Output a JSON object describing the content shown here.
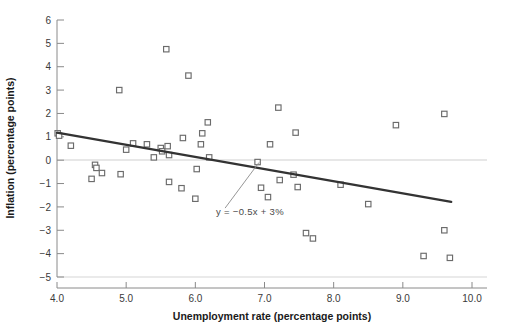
{
  "chart_data": {
    "type": "scatter",
    "title": "",
    "xlabel": "Unemployment rate (percentage points)",
    "ylabel": "Inflation (percentage points)",
    "xlim": [
      4.0,
      10.0
    ],
    "ylim": [
      -5,
      6
    ],
    "xticks": [
      "4.0",
      "5.0",
      "6.0",
      "7.0",
      "8.0",
      "9.0",
      "10.0"
    ],
    "xtick_values": [
      4.0,
      5.0,
      6.0,
      7.0,
      8.0,
      9.0,
      10.0
    ],
    "yticks": [
      "6",
      "5",
      "4",
      "3",
      "2",
      "1",
      "0",
      "−1",
      "−2",
      "−3",
      "−4",
      "−5"
    ],
    "ytick_values": [
      6,
      5,
      4,
      3,
      2,
      1,
      0,
      -1,
      -2,
      -3,
      -4,
      -5
    ],
    "grid": false,
    "zero_line": true,
    "legend": null,
    "marker": "open-square",
    "marker_color": "#6b6b6b",
    "line_color": "#333333",
    "points": [
      {
        "x": 4.01,
        "y": 1.15
      },
      {
        "x": 4.03,
        "y": 1.05
      },
      {
        "x": 4.2,
        "y": 0.62
      },
      {
        "x": 4.5,
        "y": -0.8
      },
      {
        "x": 4.55,
        "y": -0.2
      },
      {
        "x": 4.57,
        "y": -0.33
      },
      {
        "x": 4.65,
        "y": -0.55
      },
      {
        "x": 4.9,
        "y": 3.0
      },
      {
        "x": 4.92,
        "y": -0.6
      },
      {
        "x": 5.0,
        "y": 0.45
      },
      {
        "x": 5.1,
        "y": 0.72
      },
      {
        "x": 5.3,
        "y": 0.68
      },
      {
        "x": 5.4,
        "y": 0.12
      },
      {
        "x": 5.5,
        "y": 0.52
      },
      {
        "x": 5.52,
        "y": 0.38
      },
      {
        "x": 5.58,
        "y": 4.75
      },
      {
        "x": 5.6,
        "y": 0.6
      },
      {
        "x": 5.62,
        "y": 0.22
      },
      {
        "x": 5.62,
        "y": -0.93
      },
      {
        "x": 5.8,
        "y": -1.2
      },
      {
        "x": 5.82,
        "y": 0.95
      },
      {
        "x": 5.9,
        "y": 3.62
      },
      {
        "x": 6.0,
        "y": -1.65
      },
      {
        "x": 6.02,
        "y": -0.38
      },
      {
        "x": 6.08,
        "y": 0.68
      },
      {
        "x": 6.1,
        "y": 1.15
      },
      {
        "x": 6.18,
        "y": 1.62
      },
      {
        "x": 6.2,
        "y": 0.12
      },
      {
        "x": 6.9,
        "y": -0.08
      },
      {
        "x": 6.95,
        "y": -1.18
      },
      {
        "x": 7.05,
        "y": -1.58
      },
      {
        "x": 7.08,
        "y": 0.68
      },
      {
        "x": 7.2,
        "y": 2.25
      },
      {
        "x": 7.22,
        "y": -0.85
      },
      {
        "x": 7.42,
        "y": -0.62
      },
      {
        "x": 7.45,
        "y": 1.18
      },
      {
        "x": 7.48,
        "y": -1.15
      },
      {
        "x": 7.6,
        "y": -3.12
      },
      {
        "x": 7.7,
        "y": -3.35
      },
      {
        "x": 8.1,
        "y": -1.05
      },
      {
        "x": 8.5,
        "y": -1.88
      },
      {
        "x": 8.9,
        "y": 1.5
      },
      {
        "x": 9.3,
        "y": -4.1
      },
      {
        "x": 9.6,
        "y": 1.98
      },
      {
        "x": 9.6,
        "y": -3.0
      },
      {
        "x": 9.68,
        "y": -4.18
      }
    ],
    "trendline": {
      "label": "y = −0.5x + 3%",
      "slope": -0.5,
      "intercept": 3,
      "x_start": 4.0,
      "y_start": 1.18,
      "x_end": 9.7,
      "y_end": -1.78
    },
    "annotation": {
      "text": "y = −0.5x + 3%",
      "x": 6.3,
      "y": -2.35,
      "pointer_to_x": 6.92,
      "pointer_to_y": -0.1
    }
  }
}
